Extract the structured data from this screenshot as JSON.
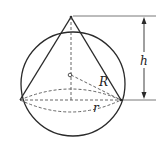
{
  "diagram": {
    "labels": {
      "height": "h",
      "sphere_radius": "R",
      "base_radius": "r"
    },
    "colors": {
      "stroke": "#2a2a2a",
      "background": "#ffffff"
    }
  }
}
